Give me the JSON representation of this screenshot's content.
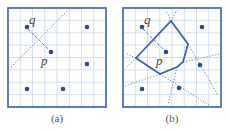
{
  "colors": {
    "frame": "#4a72b8",
    "grid": "#c9d8ee",
    "point": "#2a4a8a",
    "dotted": "#5a7fc0",
    "polygon": "#3a62ad",
    "label": "#444444"
  },
  "panels": [
    {
      "id": "a",
      "caption": "(a)",
      "frame": {
        "x": 8,
        "y": 8,
        "w": 98,
        "h": 99
      },
      "grid_cells": 8,
      "points": [
        {
          "name": "q-site",
          "x": 27,
          "y": 27
        },
        {
          "name": "p",
          "x": 51,
          "y": 52
        },
        {
          "name": "site-top-right",
          "x": 87,
          "y": 27
        },
        {
          "name": "site-right-mid",
          "x": 87,
          "y": 64
        },
        {
          "name": "site-bottom-left",
          "x": 27,
          "y": 89
        },
        {
          "name": "site-bottom-mid",
          "x": 63,
          "y": 89
        }
      ],
      "labels": [
        {
          "text": "q",
          "x": 29,
          "y": 24
        },
        {
          "text": "p",
          "x": 41,
          "y": 65
        }
      ],
      "segment_pq": {
        "x1": 28,
        "y1": 29,
        "x2": 50,
        "y2": 51
      },
      "bisectors": [
        {
          "x1": 11,
          "y1": 67,
          "x2": 68,
          "y2": 10
        }
      ]
    },
    {
      "id": "b",
      "caption": "(b)",
      "frame": {
        "x": 123,
        "y": 8,
        "w": 98,
        "h": 99
      },
      "grid_cells": 8,
      "points": [
        {
          "name": "q-site",
          "x": 142,
          "y": 27
        },
        {
          "name": "p",
          "x": 166,
          "y": 52
        },
        {
          "name": "site-top-right",
          "x": 202,
          "y": 27
        },
        {
          "name": "site-right-mid",
          "x": 200,
          "y": 65
        },
        {
          "name": "site-bottom-left",
          "x": 142,
          "y": 89
        },
        {
          "name": "site-bottom-mid",
          "x": 179,
          "y": 88
        }
      ],
      "labels": [
        {
          "text": "q",
          "x": 144,
          "y": 24
        },
        {
          "text": "p",
          "x": 156,
          "y": 65
        }
      ],
      "segment_pq": {
        "x1": 143,
        "y1": 29,
        "x2": 165,
        "y2": 51
      },
      "voronoi_cell": [
        {
          "x": 171,
          "y": 21
        },
        {
          "x": 188,
          "y": 44
        },
        {
          "x": 183,
          "y": 62
        },
        {
          "x": 177,
          "y": 67
        },
        {
          "x": 160,
          "y": 74
        },
        {
          "x": 136,
          "y": 58
        }
      ],
      "bisectors": [
        {
          "x1": 171,
          "y1": 21,
          "x2": 166,
          "y2": 10
        },
        {
          "x1": 171,
          "y1": 21,
          "x2": 177,
          "y2": 10
        },
        {
          "x1": 188,
          "y1": 44,
          "x2": 218,
          "y2": 95
        },
        {
          "x1": 183,
          "y1": 62,
          "x2": 220,
          "y2": 54
        },
        {
          "x1": 177,
          "y1": 67,
          "x2": 168,
          "y2": 105
        },
        {
          "x1": 160,
          "y1": 74,
          "x2": 125,
          "y2": 86
        },
        {
          "x1": 160,
          "y1": 74,
          "x2": 209,
          "y2": 105
        },
        {
          "x1": 136,
          "y1": 58,
          "x2": 125,
          "y2": 53
        },
        {
          "x1": 136,
          "y1": 58,
          "x2": 127,
          "y2": 67
        }
      ]
    }
  ]
}
